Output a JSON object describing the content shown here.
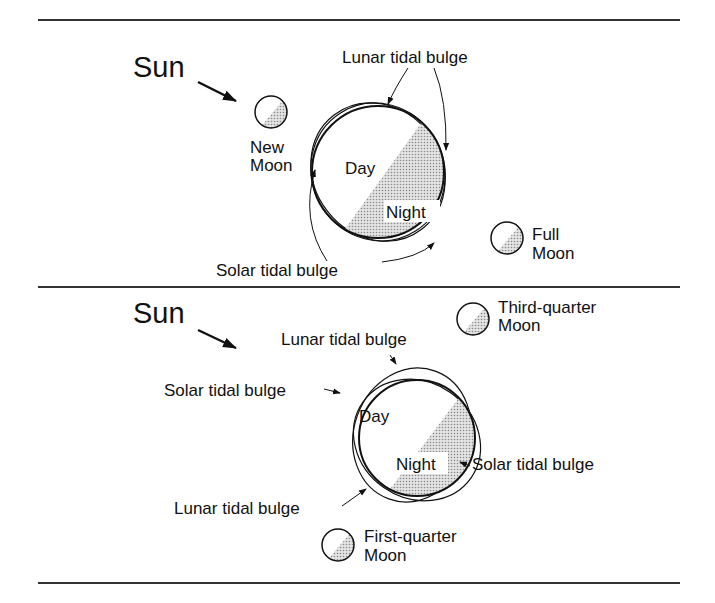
{
  "figure": {
    "top_panel": {
      "sun_label": "Sun",
      "new_moon": [
        "New",
        "Moon"
      ],
      "full_moon": [
        "Full",
        "Moon"
      ],
      "lunar_bulge_label": "Lunar tidal bulge",
      "solar_bulge_label": "Solar tidal bulge",
      "day_label": "Day",
      "night_label": "Night"
    },
    "bottom_panel": {
      "sun_label": "Sun",
      "third_quarter_moon": [
        "Third-quarter",
        "Moon"
      ],
      "first_quarter_moon": [
        "First-quarter",
        "Moon"
      ],
      "lunar_bulge_top_label": "Lunar tidal bulge",
      "lunar_bulge_bottom_label": "Lunar tidal bulge",
      "solar_bulge_left_label": "Solar tidal bulge",
      "solar_bulge_right_label": "Solar tidal bulge",
      "day_label": "Day",
      "night_label": "Night"
    },
    "colors": {
      "line": "#111111",
      "night_shade": "#c8c8c8",
      "rule": "#333333"
    }
  }
}
